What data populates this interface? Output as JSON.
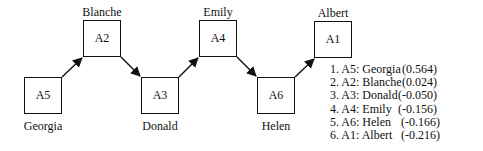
{
  "nodes": [
    {
      "id": "A5",
      "name": "Georgia",
      "x": 24,
      "y": 77,
      "label_pos": "below"
    },
    {
      "id": "A2",
      "name": "Blanche",
      "x": 83,
      "y": 20,
      "label_pos": "above"
    },
    {
      "id": "A3",
      "name": "Donald",
      "x": 141,
      "y": 77,
      "label_pos": "below"
    },
    {
      "id": "A4",
      "name": "Emily",
      "x": 199,
      "y": 20,
      "label_pos": "above"
    },
    {
      "id": "A6",
      "name": "Helen",
      "x": 257,
      "y": 77,
      "label_pos": "below"
    },
    {
      "id": "A1",
      "name": "Albert",
      "x": 314,
      "y": 21,
      "label_pos": "above"
    }
  ],
  "edges": [
    {
      "from": "A5",
      "to": "A2"
    },
    {
      "from": "A2",
      "to": "A3"
    },
    {
      "from": "A3",
      "to": "A4"
    },
    {
      "from": "A4",
      "to": "A6"
    },
    {
      "from": "A6",
      "to": "A1"
    }
  ],
  "ranking": [
    {
      "rank": "1.",
      "id": "A5",
      "name": "Georgia",
      "label": "1. A5: Georgia",
      "value": "(0.564)"
    },
    {
      "rank": "2.",
      "id": "A2",
      "name": "Blanche",
      "label": "2. A2: Blanche",
      "value": "(0.024)"
    },
    {
      "rank": "3.",
      "id": "A3",
      "name": "Donald",
      "label": "3. A3: Donald",
      "value": "(-0.050)"
    },
    {
      "rank": "4.",
      "id": "A4",
      "name": "Emily",
      "label": "4. A4: Emily",
      "value": "(-0.156)"
    },
    {
      "rank": "5.",
      "id": "A6",
      "name": "Helen",
      "label": "5. A6: Helen",
      "value": "(-0.166)"
    },
    {
      "rank": "6.",
      "id": "A1",
      "name": "Albert",
      "label": "6. A1: Albert",
      "value": "(-0.216)"
    }
  ]
}
